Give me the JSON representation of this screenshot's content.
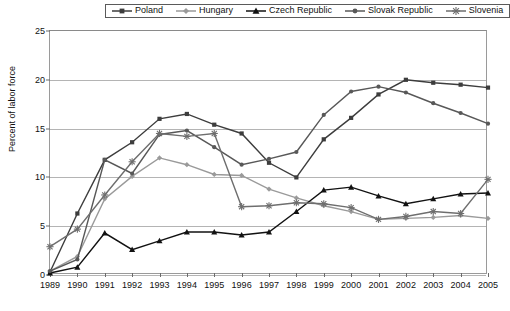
{
  "chart_data": {
    "type": "line",
    "title": "",
    "xlabel": "",
    "ylabel": "Percent of labor force",
    "xlim": [
      1989,
      2005
    ],
    "ylim": [
      0,
      25
    ],
    "yticks": [
      0,
      5,
      10,
      15,
      20,
      25
    ],
    "grid": true,
    "legend_position": "top-center",
    "x": [
      1989,
      1990,
      1991,
      1992,
      1993,
      1994,
      1995,
      1996,
      1997,
      1998,
      1999,
      2000,
      2001,
      2002,
      2003,
      2004,
      2005
    ],
    "categories": [
      "1989",
      "1990",
      "1991",
      "1992",
      "1993",
      "1994",
      "1995",
      "1996",
      "1997",
      "1998",
      "1999",
      "2000",
      "2001",
      "2002",
      "2003",
      "2004",
      "2005"
    ],
    "series": [
      {
        "name": "Poland",
        "marker": "square",
        "color": "#3d3d3d",
        "values": [
          0.3,
          6.3,
          11.8,
          13.6,
          16.0,
          16.5,
          15.4,
          14.5,
          11.5,
          10.0,
          13.9,
          16.1,
          18.5,
          20.0,
          19.7,
          19.5,
          19.2
        ]
      },
      {
        "name": "Hungary",
        "marker": "diamond",
        "color": "#9a9a9a",
        "values": [
          0.4,
          1.9,
          7.8,
          10.1,
          12.0,
          11.3,
          10.3,
          10.2,
          8.8,
          7.9,
          7.1,
          6.5,
          5.7,
          5.8,
          5.9,
          6.1,
          5.8
        ]
      },
      {
        "name": "Czech Republic",
        "marker": "triangle",
        "color": "#121212",
        "values": [
          0.2,
          0.8,
          4.3,
          2.6,
          3.5,
          4.4,
          4.4,
          4.1,
          4.4,
          6.5,
          8.7,
          9.0,
          8.1,
          7.3,
          7.8,
          8.3,
          8.4
        ]
      },
      {
        "name": "Slovak Republic",
        "marker": "circle",
        "color": "#585858",
        "values": [
          0.4,
          1.6,
          11.8,
          10.4,
          14.4,
          14.8,
          13.1,
          11.3,
          11.9,
          12.6,
          16.4,
          18.8,
          19.3,
          18.7,
          17.6,
          16.6,
          15.5
        ]
      },
      {
        "name": "Slovenia",
        "marker": "asterisk",
        "color": "#6e6e6e",
        "values": [
          2.9,
          4.7,
          8.2,
          11.6,
          14.5,
          14.2,
          14.5,
          7.0,
          7.1,
          7.4,
          7.3,
          6.9,
          5.7,
          6.0,
          6.5,
          6.3,
          9.8
        ]
      }
    ]
  },
  "figure": {
    "caption": ""
  }
}
